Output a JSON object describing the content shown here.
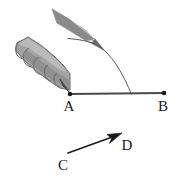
{
  "figure": {
    "background_color": "#ffffff",
    "width": 184,
    "height": 178,
    "ink_color": "#1a1a1a",
    "line_color": "#4a4a4a",
    "arc_color": "#5a5a5a"
  },
  "points": [
    {
      "id": "A",
      "label": "A",
      "x": 70,
      "y": 94,
      "label_x": 69,
      "label_y": 111,
      "dot": true
    },
    {
      "id": "B",
      "label": "B",
      "x": 164,
      "y": 93,
      "label_x": 163,
      "label_y": 111,
      "dot": true
    },
    {
      "id": "C",
      "label": "C",
      "x": 68,
      "y": 153,
      "label_x": 63,
      "label_y": 170,
      "dot": false
    },
    {
      "id": "D",
      "label": "D",
      "x": 121,
      "y": 134,
      "label_x": 126,
      "label_y": 150,
      "dot": false
    }
  ],
  "segments": [
    {
      "id": "AB",
      "name": "ray-a-b",
      "from": "A",
      "to": "B",
      "x1": 70,
      "y1": 94,
      "x2": 164,
      "y2": 93,
      "color": "#4a4a4a",
      "width": 2.1,
      "arrow": false
    },
    {
      "id": "CD",
      "name": "vector-c-d",
      "from": "C",
      "to": "D",
      "x1": 68,
      "y1": 153,
      "x2": 121,
      "y2": 134,
      "color": "#1a1a1a",
      "width": 1.5,
      "arrow": true
    }
  ],
  "arc": {
    "name": "compass-arc",
    "color": "#5a5a5a",
    "width": 1.0,
    "path": "M 67.5 38.5 C 82 39.5 95 42 104 50 C 115 60 124 76 131.5 94.5",
    "start_x": 67.5,
    "start_y": 38.5,
    "end_x": 131.5,
    "end_y": 94.5,
    "tick_x": 131,
    "tick_y": 94
  },
  "pencil": {
    "name": "pencil",
    "tip_x": 104,
    "tip_y": 50,
    "body_path": "M 52 10 L 97 37 L 104 50 L 90 42 L 58 24 Z",
    "shade_dark_path": "M 52 10 L 90 32 L 97 37 L 58 24 Z",
    "shade_light_path": "M 90 32 L 104 50 L 90 42 Z",
    "colors": {
      "dark": "#838383",
      "mid": "#a8a8a8",
      "light": "#dedede",
      "outline": "#6f6f6f"
    }
  },
  "compass_grip": {
    "name": "compass-grip",
    "colors": {
      "body": "#a3a3a3",
      "shadow": "#8a8a8a",
      "highlight": "#bcbcbc",
      "outline": "#6b6b6b",
      "tip": "#5a5a5a"
    },
    "outline_path": "M 17 43 L 28 37 L 42 46 L 54 56 L 64 66 L 70 74 L 70 90 L 60 88 L 48 80 L 35 70 L 24 60 L 16 51 Z",
    "segment_arcs": [
      {
        "cx": 27,
        "cy": 49,
        "r": 9.5
      },
      {
        "cx": 36,
        "cy": 57,
        "r": 9.5
      },
      {
        "cx": 45,
        "cy": 65,
        "r": 9.0
      },
      {
        "cx": 53,
        "cy": 72,
        "r": 8.5
      },
      {
        "cx": 60,
        "cy": 79,
        "r": 7.5
      }
    ],
    "needle_path": "M 62 82 L 70 93 L 64 88 Z"
  },
  "arrowhead": {
    "name": "arrowhead-d",
    "path": "M 121 134 L 108 134 L 112 139 L 110 144 Z",
    "color": "#1a1a1a"
  }
}
